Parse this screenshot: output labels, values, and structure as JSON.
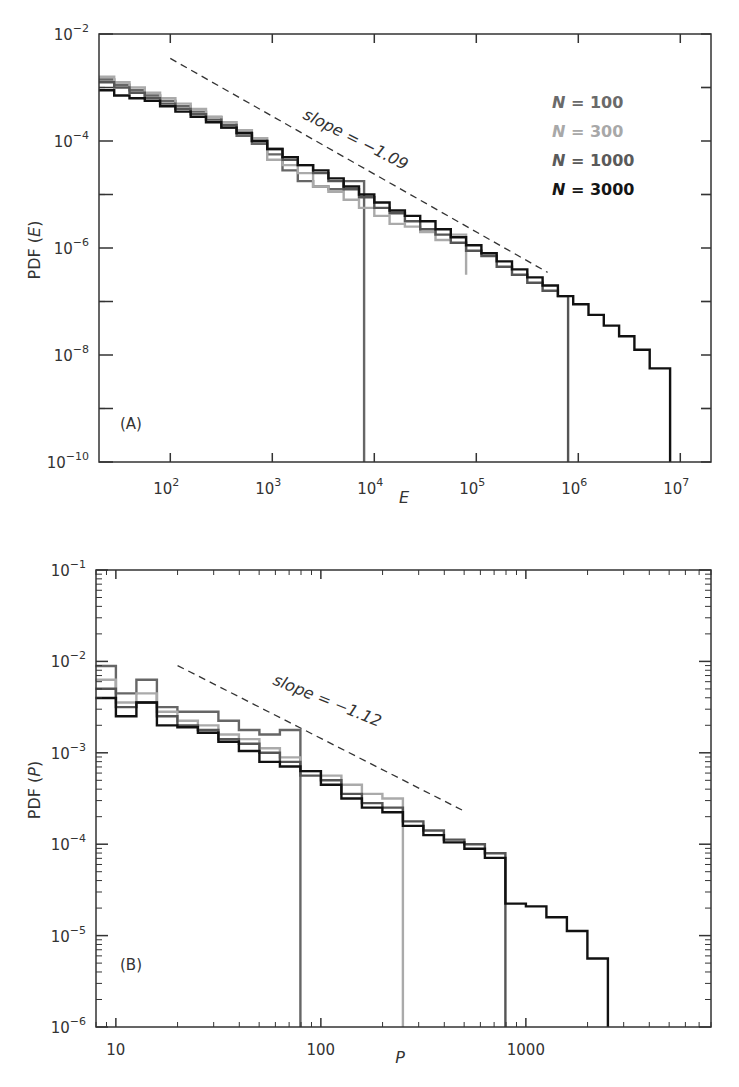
{
  "chart_data": [
    {
      "panel": "A",
      "type": "line",
      "subtype": "step-histogram",
      "title": "",
      "panel_label": "(A)",
      "xlabel": "E",
      "ylabel": "PDF (E)",
      "xscale": "log",
      "yscale": "log",
      "xlim": [
        20,
        20000000
      ],
      "ylim": [
        1e-10,
        0.01
      ],
      "x_ticks": [
        {
          "value": 100,
          "base": "10",
          "exp": "2"
        },
        {
          "value": 1000,
          "base": "10",
          "exp": "3"
        },
        {
          "value": 10000,
          "base": "10",
          "exp": "4"
        },
        {
          "value": 100000,
          "base": "10",
          "exp": "5"
        },
        {
          "value": 1000000,
          "base": "10",
          "exp": "6"
        },
        {
          "value": 10000000,
          "base": "10",
          "exp": "7"
        }
      ],
      "y_ticks": [
        {
          "value": 0.01,
          "base": "10",
          "exp": "−2"
        },
        {
          "value": 0.0001,
          "base": "10",
          "exp": "−4"
        },
        {
          "value": 1e-06,
          "base": "10",
          "exp": "−6"
        },
        {
          "value": 1e-08,
          "base": "10",
          "exp": "−8"
        },
        {
          "value": 1e-10,
          "base": "10",
          "exp": "−10"
        }
      ],
      "grid": false,
      "legend_position": "upper right",
      "annotation": {
        "text": "slope = −1.09",
        "x_from": 100,
        "y_from": 0.0035,
        "x_to": 500000,
        "y_to": 3.5e-07
      },
      "series": [
        {
          "name": "N = 100",
          "color": "#666666",
          "cutoff": 8000,
          "log_x_edges": [
            1.3,
            1.45,
            1.6,
            1.75,
            1.9,
            2.05,
            2.2,
            2.35,
            2.5,
            2.65,
            2.8,
            2.95,
            3.1,
            3.25,
            3.4,
            3.55,
            3.7,
            3.9
          ],
          "log_y": [
            -2.85,
            -2.95,
            -3.05,
            -3.15,
            -3.25,
            -3.35,
            -3.45,
            -3.55,
            -3.75,
            -3.9,
            -4.05,
            -4.25,
            -4.55,
            -4.75,
            -4.85,
            -4.9,
            -4.75
          ]
        },
        {
          "name": "N = 300",
          "color": "#aaaaaa",
          "cutoff": 80000,
          "log_x_edges": [
            1.3,
            1.45,
            1.6,
            1.75,
            1.9,
            2.05,
            2.2,
            2.35,
            2.5,
            2.65,
            2.8,
            2.95,
            3.1,
            3.25,
            3.4,
            3.55,
            3.7,
            3.85,
            4.0,
            4.15,
            4.3,
            4.45,
            4.6,
            4.75,
            4.9
          ],
          "log_y": [
            -2.8,
            -2.9,
            -3.0,
            -3.1,
            -3.2,
            -3.3,
            -3.4,
            -3.55,
            -3.65,
            -3.8,
            -3.95,
            -4.35,
            -4.45,
            -4.6,
            -4.85,
            -4.95,
            -5.1,
            -5.25,
            -5.4,
            -5.55,
            -5.6,
            -5.7,
            -5.85,
            -5.75,
            -6.5
          ]
        },
        {
          "name": "N = 1000",
          "color": "#555555",
          "cutoff": 800000,
          "log_x_edges": [
            1.3,
            1.45,
            1.6,
            1.75,
            1.9,
            2.05,
            2.2,
            2.35,
            2.5,
            2.65,
            2.8,
            2.95,
            3.1,
            3.25,
            3.4,
            3.55,
            3.7,
            3.85,
            4.0,
            4.15,
            4.3,
            4.45,
            4.6,
            4.75,
            4.9,
            5.05,
            5.2,
            5.35,
            5.5,
            5.65,
            5.8,
            5.9
          ],
          "log_y": [
            -2.9,
            -3.0,
            -3.1,
            -3.2,
            -3.3,
            -3.4,
            -3.5,
            -3.6,
            -3.7,
            -3.85,
            -4.0,
            -4.15,
            -4.35,
            -4.45,
            -4.6,
            -4.75,
            -4.9,
            -5.05,
            -5.25,
            -5.35,
            -5.5,
            -5.65,
            -5.75,
            -5.9,
            -6.05,
            -6.15,
            -6.35,
            -6.5,
            -6.65,
            -6.8,
            -6.9
          ]
        },
        {
          "name": "N = 3000",
          "color": "#111111",
          "cutoff": 8000000,
          "log_x_edges": [
            1.3,
            1.45,
            1.6,
            1.75,
            1.9,
            2.05,
            2.2,
            2.35,
            2.5,
            2.65,
            2.8,
            2.95,
            3.1,
            3.25,
            3.4,
            3.55,
            3.7,
            3.85,
            4.0,
            4.15,
            4.3,
            4.45,
            4.6,
            4.75,
            4.9,
            5.05,
            5.2,
            5.35,
            5.5,
            5.65,
            5.8,
            5.95,
            6.1,
            6.25,
            6.4,
            6.55,
            6.7,
            6.9
          ],
          "log_y": [
            -3.05,
            -3.15,
            -3.2,
            -3.25,
            -3.35,
            -3.45,
            -3.55,
            -3.65,
            -3.75,
            -3.85,
            -4.0,
            -4.15,
            -4.3,
            -4.45,
            -4.55,
            -4.7,
            -4.85,
            -5.0,
            -5.15,
            -5.3,
            -5.4,
            -5.5,
            -5.65,
            -5.8,
            -5.95,
            -6.1,
            -6.25,
            -6.4,
            -6.55,
            -6.7,
            -6.9,
            -7.05,
            -7.25,
            -7.45,
            -7.65,
            -7.9,
            -8.25
          ]
        }
      ]
    },
    {
      "panel": "B",
      "type": "line",
      "subtype": "step-histogram",
      "title": "",
      "panel_label": "(B)",
      "xlabel": "P",
      "ylabel": "PDF (P)",
      "xscale": "log",
      "yscale": "log",
      "xlim": [
        8,
        8000
      ],
      "ylim": [
        1e-06,
        0.1
      ],
      "x_ticks": [
        {
          "value": 10,
          "label": "10"
        },
        {
          "value": 100,
          "label": "100"
        },
        {
          "value": 1000,
          "label": "1000"
        }
      ],
      "y_ticks": [
        {
          "value": 0.1,
          "base": "10",
          "exp": "−1"
        },
        {
          "value": 0.01,
          "base": "10",
          "exp": "−2"
        },
        {
          "value": 0.001,
          "base": "10",
          "exp": "−3"
        },
        {
          "value": 0.0001,
          "base": "10",
          "exp": "−4"
        },
        {
          "value": 1e-05,
          "base": "10",
          "exp": "−5"
        },
        {
          "value": 1e-06,
          "base": "10",
          "exp": "−6"
        }
      ],
      "grid": false,
      "annotation": {
        "text": "slope = −1.12",
        "x_from": 20,
        "y_from": 0.009,
        "x_to": 500,
        "y_to": 0.00023
      },
      "series": [
        {
          "name": "N = 100",
          "color": "#666666",
          "cutoff": 80,
          "log_x_edges": [
            0.9,
            1.0,
            1.1,
            1.2,
            1.3,
            1.4,
            1.5,
            1.6,
            1.7,
            1.8,
            1.9
          ],
          "log_y": [
            -2.05,
            -2.35,
            -2.2,
            -2.5,
            -2.55,
            -2.55,
            -2.65,
            -2.75,
            -2.8,
            -2.75
          ]
        },
        {
          "name": "N = 300",
          "color": "#aaaaaa",
          "cutoff": 250,
          "log_x_edges": [
            0.9,
            1.0,
            1.1,
            1.2,
            1.3,
            1.4,
            1.5,
            1.6,
            1.7,
            1.8,
            1.9,
            2.0,
            2.1,
            2.2,
            2.3,
            2.4
          ],
          "log_y": [
            -2.2,
            -2.45,
            -2.35,
            -2.55,
            -2.65,
            -2.7,
            -2.8,
            -2.85,
            -2.95,
            -3.05,
            -3.2,
            -3.25,
            -3.35,
            -3.45,
            -3.5
          ]
        },
        {
          "name": "N = 1000",
          "color": "#555555",
          "cutoff": 800,
          "log_x_edges": [
            0.9,
            1.0,
            1.1,
            1.2,
            1.3,
            1.4,
            1.5,
            1.6,
            1.7,
            1.8,
            1.9,
            2.0,
            2.1,
            2.2,
            2.3,
            2.4,
            2.5,
            2.6,
            2.7,
            2.8,
            2.9
          ],
          "log_y": [
            -2.3,
            -2.5,
            -2.45,
            -2.6,
            -2.7,
            -2.75,
            -2.85,
            -2.9,
            -3.0,
            -3.1,
            -3.25,
            -3.3,
            -3.45,
            -3.55,
            -3.6,
            -3.75,
            -3.85,
            -3.95,
            -4.0,
            -4.1
          ]
        },
        {
          "name": "N = 3000",
          "color": "#111111",
          "cutoff": 2500,
          "log_x_edges": [
            0.9,
            1.0,
            1.1,
            1.2,
            1.3,
            1.4,
            1.5,
            1.6,
            1.7,
            1.8,
            1.9,
            2.0,
            2.1,
            2.2,
            2.3,
            2.4,
            2.5,
            2.6,
            2.7,
            2.8,
            2.9,
            3.0,
            3.1,
            3.2,
            3.3,
            3.4
          ],
          "log_y": [
            -2.4,
            -2.6,
            -2.45,
            -2.7,
            -2.72,
            -2.78,
            -2.88,
            -2.98,
            -3.1,
            -3.15,
            -3.2,
            -3.35,
            -3.5,
            -3.6,
            -3.65,
            -3.8,
            -3.9,
            -3.98,
            -4.05,
            -4.15,
            -4.65,
            -4.68,
            -4.8,
            -4.95,
            -5.25
          ]
        }
      ]
    }
  ],
  "panelA": {
    "ylabel": "PDF (E)",
    "xlabel": "E",
    "label": "(A)",
    "slope_text": "slope = −1.09",
    "legend": [
      {
        "text": "N = 100",
        "color": "#6a6a6a"
      },
      {
        "text": "N = 300",
        "color": "#a8a8a8"
      },
      {
        "text": "N = 1000",
        "color": "#5a5a5a"
      },
      {
        "text": "N = 3000",
        "color": "#151515"
      }
    ]
  },
  "panelB": {
    "ylabel": "PDF (P)",
    "xlabel": "P",
    "label": "(B)",
    "slope_text": "slope = −1.12"
  }
}
